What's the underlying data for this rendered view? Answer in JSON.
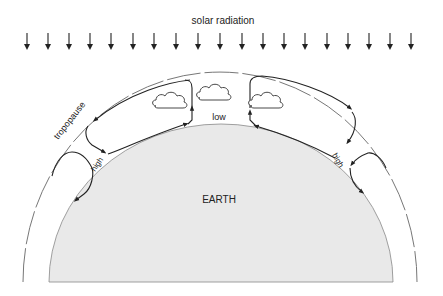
{
  "diagram": {
    "title": "solar radiation",
    "labels": {
      "tropopause": "tropopause",
      "low": "low",
      "high_left": "high",
      "high_right": "high",
      "earth": "EARTH"
    },
    "solar_arrow_count": 19,
    "clouds": 3,
    "colors": {
      "earth_fill": "#e9e9e9",
      "ink": "#222222",
      "tropopause": "#777777"
    }
  }
}
